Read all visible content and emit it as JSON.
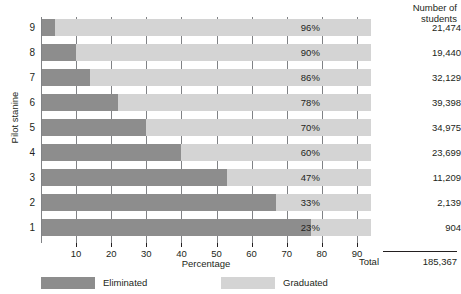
{
  "chart_data": {
    "type": "bar",
    "subtype": "horizontal-stacked",
    "title": "",
    "xlabel": "Percentage",
    "ylabel": "Pilot stanine",
    "xlim": [
      0,
      94
    ],
    "xticks": [
      10,
      20,
      30,
      40,
      50,
      60,
      70,
      80,
      90
    ],
    "grid": true,
    "grid_axis": "x",
    "categories": [
      "9",
      "8",
      "7",
      "6",
      "5",
      "4",
      "3",
      "2",
      "1"
    ],
    "series": [
      {
        "name": "Eliminated",
        "color": "#8d8d8d",
        "values": [
          4,
          10,
          14,
          22,
          30,
          40,
          53,
          67,
          77
        ]
      },
      {
        "name": "Graduated",
        "color": "#d4d4d4",
        "values": [
          96,
          90,
          86,
          78,
          70,
          60,
          47,
          33,
          23
        ]
      }
    ],
    "bar_total_percent": 94,
    "rows": [
      {
        "stanine": "9",
        "eliminated_pct": 4,
        "graduated_pct": 96,
        "pct_label": "96%",
        "students": "21,474"
      },
      {
        "stanine": "8",
        "eliminated_pct": 10,
        "graduated_pct": 90,
        "pct_label": "90%",
        "students": "19,440"
      },
      {
        "stanine": "7",
        "eliminated_pct": 14,
        "graduated_pct": 86,
        "pct_label": "86%",
        "students": "32,129"
      },
      {
        "stanine": "6",
        "eliminated_pct": 22,
        "graduated_pct": 78,
        "pct_label": "78%",
        "students": "39,398"
      },
      {
        "stanine": "5",
        "eliminated_pct": 30,
        "graduated_pct": 70,
        "pct_label": "70%",
        "students": "34,975"
      },
      {
        "stanine": "4",
        "eliminated_pct": 40,
        "graduated_pct": 60,
        "pct_label": "60%",
        "students": "23,699"
      },
      {
        "stanine": "3",
        "eliminated_pct": 53,
        "graduated_pct": 47,
        "pct_label": "47%",
        "students": "11,209"
      },
      {
        "stanine": "2",
        "eliminated_pct": 67,
        "graduated_pct": 33,
        "pct_label": "33%",
        "students": "2,139"
      },
      {
        "stanine": "1",
        "eliminated_pct": 77,
        "graduated_pct": 23,
        "pct_label": "23%",
        "students": "904"
      }
    ],
    "legend": [
      {
        "label": "Eliminated",
        "color": "#8d8d8d"
      },
      {
        "label": "Graduated",
        "color": "#d4d4d4"
      }
    ],
    "annotations": {
      "column_header_line1": "Number of",
      "column_header_line2": "students",
      "total_label": "Total",
      "total_value": "185,367"
    }
  },
  "colors": {
    "eliminated": "#8d8d8d",
    "graduated": "#d4d4d4",
    "gridline": "#808285",
    "text": "#231f20",
    "background": "#ffffff"
  }
}
